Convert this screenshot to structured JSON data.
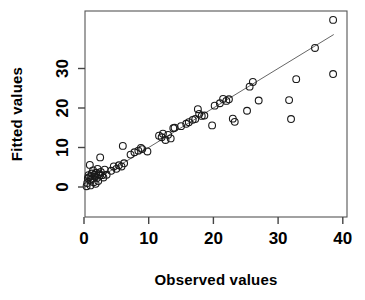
{
  "chart_data": {
    "type": "scatter",
    "title": "",
    "xlabel": "Observed values",
    "ylabel": "Fitted values",
    "xlim": [
      0,
      40
    ],
    "ylim": [
      0,
      38
    ],
    "xticks": [
      0,
      10,
      20,
      30,
      40
    ],
    "yticks": [
      0,
      10,
      20,
      30
    ],
    "xtick_labels": [
      "0",
      "10",
      "20",
      "30",
      "40"
    ],
    "ytick_labels": [
      "0",
      "10",
      "20",
      "30"
    ],
    "grid": false,
    "legend": null,
    "marker": "open-circle",
    "marker_color": "#1a1a1a",
    "reference_line": {
      "name": "one-to-one-line",
      "type": "line",
      "slope": 1,
      "intercept": 0,
      "x_start": 0.2,
      "y_start": 0.2,
      "x_end": 38.6,
      "y_end": 38.6,
      "color": "#666666"
    },
    "points": [
      [
        0.4,
        0.2
      ],
      [
        0.5,
        1.0
      ],
      [
        0.6,
        2.2
      ],
      [
        0.7,
        3.0
      ],
      [
        0.8,
        2.5
      ],
      [
        0.9,
        5.6
      ],
      [
        1.0,
        0.4
      ],
      [
        1.0,
        1.8
      ],
      [
        1.1,
        2.8
      ],
      [
        1.2,
        3.4
      ],
      [
        1.3,
        2.1
      ],
      [
        1.4,
        4.2
      ],
      [
        1.5,
        1.2
      ],
      [
        1.6,
        3.1
      ],
      [
        1.7,
        2.6
      ],
      [
        1.8,
        0.8
      ],
      [
        1.9,
        3.6
      ],
      [
        2.0,
        2.3
      ],
      [
        2.1,
        4.6
      ],
      [
        2.2,
        1.5
      ],
      [
        2.3,
        3.2
      ],
      [
        2.4,
        2.9
      ],
      [
        2.5,
        7.5
      ],
      [
        2.6,
        3.8
      ],
      [
        2.8,
        3.0
      ],
      [
        3.0,
        2.4
      ],
      [
        3.2,
        4.4
      ],
      [
        3.5,
        3.1
      ],
      [
        4.2,
        4.1
      ],
      [
        4.6,
        5.2
      ],
      [
        5.0,
        4.6
      ],
      [
        5.4,
        5.5
      ],
      [
        5.8,
        5.2
      ],
      [
        6.0,
        10.4
      ],
      [
        6.2,
        6.0
      ],
      [
        7.2,
        8.2
      ],
      [
        7.8,
        8.8
      ],
      [
        8.4,
        9.2
      ],
      [
        8.8,
        9.9
      ],
      [
        9.0,
        9.6
      ],
      [
        9.8,
        9.0
      ],
      [
        11.6,
        13.0
      ],
      [
        12.0,
        12.6
      ],
      [
        12.2,
        13.5
      ],
      [
        12.6,
        11.9
      ],
      [
        13.0,
        13.2
      ],
      [
        13.4,
        12.3
      ],
      [
        13.8,
        14.9
      ],
      [
        14.0,
        15.0
      ],
      [
        15.0,
        15.4
      ],
      [
        15.8,
        16.0
      ],
      [
        16.2,
        16.4
      ],
      [
        16.8,
        17.0
      ],
      [
        17.2,
        17.2
      ],
      [
        17.6,
        19.7
      ],
      [
        17.8,
        18.5
      ],
      [
        18.2,
        18.0
      ],
      [
        18.6,
        18.1
      ],
      [
        19.8,
        15.6
      ],
      [
        20.2,
        20.6
      ],
      [
        21.0,
        21.2
      ],
      [
        21.5,
        22.3
      ],
      [
        22.0,
        21.8
      ],
      [
        22.4,
        22.2
      ],
      [
        23.0,
        17.3
      ],
      [
        23.3,
        16.5
      ],
      [
        25.2,
        19.3
      ],
      [
        25.6,
        25.4
      ],
      [
        26.1,
        26.6
      ],
      [
        27.0,
        21.9
      ],
      [
        31.7,
        22.0
      ],
      [
        32.0,
        17.2
      ],
      [
        32.8,
        27.3
      ],
      [
        35.7,
        35.2
      ],
      [
        38.5,
        42.3
      ],
      [
        38.5,
        28.6
      ]
    ]
  },
  "axis": {
    "x_title": "Observed values",
    "y_title": "Fitted values"
  }
}
